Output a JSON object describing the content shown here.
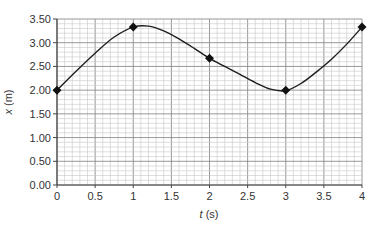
{
  "chart_data": {
    "type": "line",
    "title": "",
    "xlabel_var": "t",
    "xlabel_unit": " (s)",
    "ylabel_var": "x",
    "ylabel_unit": " (m)",
    "xlim": [
      0,
      4
    ],
    "ylim": [
      0,
      3.5
    ],
    "x_ticks": [
      "0",
      "0.5",
      "1",
      "1.5",
      "2",
      "2.5",
      "3",
      "3.5",
      "4"
    ],
    "y_ticks": [
      "0.00",
      "0.50",
      "1.00",
      "1.50",
      "2.00",
      "2.50",
      "3.00",
      "3.50"
    ],
    "grid": true,
    "grid_minor_per_major": 5,
    "series": [
      {
        "name": "position",
        "marker": "diamond",
        "points": [
          {
            "t": 0,
            "x": 2.0
          },
          {
            "t": 1,
            "x": 3.33
          },
          {
            "t": 2,
            "x": 2.67
          },
          {
            "t": 3,
            "x": 2.0
          },
          {
            "t": 4,
            "x": 3.33
          }
        ]
      }
    ],
    "curve_samples": [
      [
        0,
        2.0
      ],
      [
        0.25,
        2.4
      ],
      [
        0.5,
        2.78
      ],
      [
        0.75,
        3.12
      ],
      [
        1.0,
        3.33
      ],
      [
        1.2,
        3.35
      ],
      [
        1.4,
        3.25
      ],
      [
        1.6,
        3.08
      ],
      [
        1.8,
        2.88
      ],
      [
        2.0,
        2.67
      ],
      [
        2.2,
        2.5
      ],
      [
        2.4,
        2.33
      ],
      [
        2.6,
        2.16
      ],
      [
        2.8,
        2.02
      ],
      [
        3.0,
        1.99
      ],
      [
        3.2,
        2.14
      ],
      [
        3.4,
        2.38
      ],
      [
        3.6,
        2.65
      ],
      [
        3.8,
        2.97
      ],
      [
        4.0,
        3.33
      ]
    ]
  },
  "colors": {
    "grid_minor": "#c8c8c8",
    "grid_major": "#8c8c8c",
    "axis": "#444444",
    "curve": "#1e1e1e",
    "marker": "#111111"
  }
}
